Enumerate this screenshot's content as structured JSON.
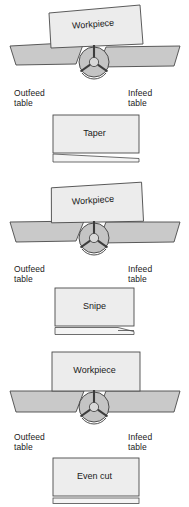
{
  "diagram": {
    "colors": {
      "table_fill": "#c9c9c9",
      "table_stroke": "#4a4a4a",
      "workpiece_fill": "#ececec",
      "workpiece_stroke": "#4a4a4a",
      "cutter_fill": "#c4c4c4",
      "cutter_stroke": "#3c3c3c",
      "result_fill": "#ededed",
      "result_stroke": "#4a4a4a",
      "text": "#1a1a1a",
      "background": "#ffffff"
    },
    "common_labels": {
      "workpiece": "Workpiece",
      "outfeed_table": "Outfeed\ntable",
      "infeed_table": "Infeed\ntable"
    },
    "panels": [
      {
        "id": "taper",
        "workpiece_label": "Workpiece",
        "outfeed_label": "Outfeed\ntable",
        "infeed_label": "Infeed\ntable",
        "result_label": "Taper",
        "tilt": "down-right",
        "tilt_degrees": -6
      },
      {
        "id": "snipe",
        "workpiece_label": "Workpiece",
        "outfeed_label": "Outfeed\ntable",
        "infeed_label": "Infeed\ntable",
        "result_label": "Snipe",
        "tilt": "down-left",
        "tilt_degrees": 6
      },
      {
        "id": "even-cut",
        "workpiece_label": "Workpiece",
        "outfeed_label": "Outfeed\ntable",
        "infeed_label": "Infeed\ntable",
        "result_label": "Even cut",
        "tilt": "level",
        "tilt_degrees": 0
      }
    ]
  }
}
